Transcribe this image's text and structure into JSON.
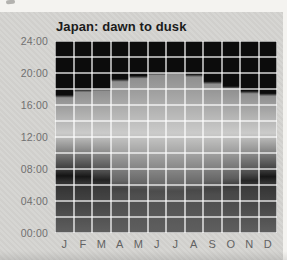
{
  "window": {
    "title": "Japan: dawn to dusk"
  },
  "chart_data": {
    "type": "area",
    "title": "Japan: dawn to dusk",
    "subtitle": "",
    "xlabel": "",
    "ylabel": "",
    "categories": [
      "J",
      "F",
      "M",
      "A",
      "M",
      "J",
      "J",
      "A",
      "S",
      "O",
      "N",
      "D"
    ],
    "y_ticks": [
      "24:00",
      "20:00",
      "16:00",
      "12:00",
      "08:00",
      "04:00",
      "00:00"
    ],
    "ylim": [
      0,
      24
    ],
    "y_tick_step_hours": 4,
    "grid": true,
    "grid_cell_hours": 2,
    "legend_position": "none",
    "series": [
      {
        "name": "dawn",
        "unit": "hours",
        "values": [
          7.0,
          6.9,
          6.5,
          5.4,
          5.25,
          5.1,
          5.1,
          5.2,
          5.4,
          5.75,
          6.4,
          6.9
        ],
        "labels": [
          "07:00",
          "06:55",
          "06:30",
          "05:25",
          "05:15",
          "05:05",
          "05:05",
          "05:10",
          "05:25",
          "05:45",
          "06:25",
          "06:55"
        ]
      },
      {
        "name": "dusk",
        "unit": "hours",
        "values": [
          17.2,
          17.9,
          18.05,
          19.2,
          19.6,
          20.0,
          20.1,
          19.8,
          18.9,
          18.3,
          17.7,
          17.4
        ],
        "labels": [
          "17:10",
          "17:55",
          "18:05",
          "19:10",
          "19:35",
          "20:00",
          "20:05",
          "19:50",
          "18:55",
          "18:20",
          "17:40",
          "17:25"
        ]
      }
    ],
    "colors": {
      "night_top_black": "#0c0c0c",
      "dusk_shoulder_gray": "#8f8f8f",
      "noon_light_gray": "#cbcbca",
      "pre_dawn_winter": "#141414",
      "pre_dawn_summer": "#4c4c4c",
      "pre_dawn_upper_winter": "#3f3f3f",
      "pre_dawn_upper_summer": "#6c6c6c",
      "post_dawn_winter": "#303030",
      "post_dawn_summer": "#525252",
      "midnight_gray": "#5f5f5f",
      "gridline_white": "rgba(255,255,255,0.62)",
      "paper_gray": "#d5d4d1",
      "axis_label_gray": "#707070",
      "title_ink": "#1b1b1b"
    }
  }
}
